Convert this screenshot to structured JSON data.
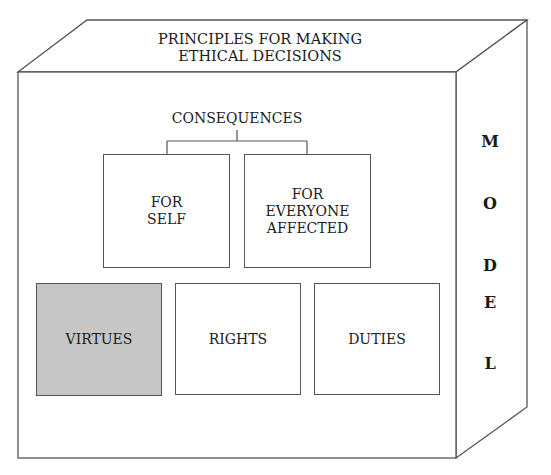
{
  "title": "PRINCIPLES FOR MAKING\nETHICAL DECISIONS",
  "side_label": {
    "text": "MODEL",
    "letters": [
      "M",
      "O",
      "D",
      "E",
      "L"
    ]
  },
  "consequences": {
    "label": "CONSEQUENCES",
    "children": [
      {
        "label": "FOR\nSELF"
      },
      {
        "label": "FOR\nEVERYONE\nAFFECTED"
      }
    ]
  },
  "principles": [
    {
      "label": "VIRTUES",
      "highlighted": true,
      "fill": "#c6c6c6"
    },
    {
      "label": "RIGHTS",
      "highlighted": false,
      "fill": "#ffffff"
    },
    {
      "label": "DUTIES",
      "highlighted": false,
      "fill": "#ffffff"
    }
  ]
}
